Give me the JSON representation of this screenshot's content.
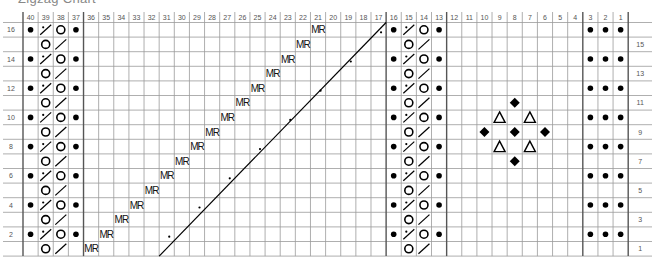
{
  "title": "Zigzag Chart",
  "chart_data": {
    "type": "table",
    "kind": "knitting-chart",
    "columns": 40,
    "rows": 16,
    "column_labels": [
      "40",
      "39",
      "38",
      "37",
      "36",
      "35",
      "34",
      "33",
      "32",
      "31",
      "30",
      "29",
      "28",
      "27",
      "26",
      "25",
      "24",
      "23",
      "22",
      "21",
      "20",
      "19",
      "18",
      "17",
      "16",
      "15",
      "14",
      "13",
      "12",
      "11",
      "10",
      "9",
      "8",
      "7",
      "6",
      "5",
      "4",
      "3",
      "2",
      "1"
    ],
    "row_labels_left": [
      "16",
      "14",
      "12",
      "10",
      "8",
      "6",
      "4",
      "2"
    ],
    "row_labels_right": [
      "15",
      "13",
      "11",
      "9",
      "7",
      "5",
      "3",
      "1"
    ],
    "thick_lines_after_columns": [
      37,
      17,
      13,
      4
    ],
    "symbols": {
      "bullet": "purl",
      "circle": "yarn-over",
      "slash": "k2tog",
      "slash_dot": "k2tog-purl",
      "diamond": "bobble",
      "triangle": "triangle-stitch",
      "MR": "make-right"
    },
    "cells": {
      "even_rows_cable": [
        {
          "col": 40,
          "sym": "bullet"
        },
        {
          "col": 39,
          "sym": "slash_dot"
        },
        {
          "col": 38,
          "sym": "circle"
        },
        {
          "col": 37,
          "sym": "bullet"
        },
        {
          "col": 16,
          "sym": "bullet"
        },
        {
          "col": 15,
          "sym": "slash_dot"
        },
        {
          "col": 14,
          "sym": "circle"
        },
        {
          "col": 13,
          "sym": "bullet"
        },
        {
          "col": 3,
          "sym": "bullet"
        },
        {
          "col": 2,
          "sym": "bullet"
        },
        {
          "col": 1,
          "sym": "bullet"
        }
      ],
      "odd_rows_cable": [
        {
          "col": 39,
          "sym": "circle"
        },
        {
          "col": 38,
          "sym": "slash"
        },
        {
          "col": 15,
          "sym": "circle"
        },
        {
          "col": 14,
          "sym": "slash"
        }
      ],
      "mr": [
        {
          "row": 16,
          "col": 21
        },
        {
          "row": 15,
          "col": 22
        },
        {
          "row": 14,
          "col": 23
        },
        {
          "row": 13,
          "col": 24
        },
        {
          "row": 12,
          "col": 25
        },
        {
          "row": 11,
          "col": 26
        },
        {
          "row": 10,
          "col": 27
        },
        {
          "row": 9,
          "col": 28
        },
        {
          "row": 8,
          "col": 29
        },
        {
          "row": 7,
          "col": 30
        },
        {
          "row": 6,
          "col": 31
        },
        {
          "row": 5,
          "col": 32
        },
        {
          "row": 4,
          "col": 33
        },
        {
          "row": 3,
          "col": 34
        },
        {
          "row": 2,
          "col": 35
        },
        {
          "row": 1,
          "col": 36
        }
      ],
      "diagonal": {
        "from": {
          "row": 1,
          "col": 31,
          "corner": "bottom-left"
        },
        "to": {
          "row": 16,
          "col": 17,
          "corner": "top-right"
        }
      },
      "diagonal_dots": [
        {
          "row": 16,
          "col": 17
        },
        {
          "row": 14,
          "col": 19
        },
        {
          "row": 12,
          "col": 21
        },
        {
          "row": 10,
          "col": 23
        },
        {
          "row": 8,
          "col": 25
        },
        {
          "row": 6,
          "col": 27
        },
        {
          "row": 4,
          "col": 29
        },
        {
          "row": 2,
          "col": 31
        }
      ],
      "motif": [
        {
          "row": 11,
          "col": 8,
          "sym": "diamond"
        },
        {
          "row": 10,
          "col": 9,
          "sym": "triangle"
        },
        {
          "row": 10,
          "col": 7,
          "sym": "triangle"
        },
        {
          "row": 9,
          "col": 10,
          "sym": "diamond"
        },
        {
          "row": 9,
          "col": 8,
          "sym": "diamond"
        },
        {
          "row": 9,
          "col": 6,
          "sym": "diamond"
        },
        {
          "row": 8,
          "col": 9,
          "sym": "triangle"
        },
        {
          "row": 8,
          "col": 7,
          "sym": "triangle"
        },
        {
          "row": 7,
          "col": 8,
          "sym": "diamond"
        }
      ]
    },
    "mr_label": "MR"
  }
}
